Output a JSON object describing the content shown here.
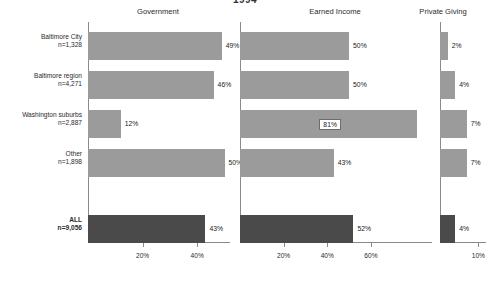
{
  "chart_data": {
    "type": "bar",
    "orientation": "horizontal",
    "title": "1994",
    "categories": [
      "Baltimore City",
      "Baltimore region",
      "Washington suburbs",
      "Other",
      "ALL"
    ],
    "category_sublabels": [
      "n=1,328",
      "n=4,271",
      "n=2,887",
      "n=1,898",
      "n=9,056"
    ],
    "panels": [
      {
        "name": "Government",
        "values": [
          49,
          46,
          12,
          50,
          43
        ],
        "value_labels": [
          "49%",
          "46%",
          "12%",
          "50%",
          "43%"
        ],
        "label_placement": [
          "outside",
          "outside",
          "outside",
          "outside",
          "outside"
        ],
        "xlim": [
          0,
          52
        ],
        "ticks": [
          20,
          40
        ],
        "tick_labels": [
          "20%",
          "40%"
        ]
      },
      {
        "name": "Earned Income",
        "values": [
          50,
          50,
          81,
          43,
          52
        ],
        "value_labels": [
          "50%",
          "50%",
          "81%",
          "43%",
          "52%"
        ],
        "label_placement": [
          "outside",
          "outside",
          "inside",
          "outside",
          "outside"
        ],
        "xlim": [
          0,
          88
        ],
        "ticks": [
          20,
          40,
          60
        ],
        "tick_labels": [
          "20%",
          "40%",
          "60%"
        ]
      },
      {
        "name": "Private Giving",
        "values": [
          2,
          4,
          7,
          7,
          4
        ],
        "value_labels": [
          "2%",
          "4%",
          "7%",
          "7%",
          "4%"
        ],
        "label_placement": [
          "outside",
          "outside",
          "outside",
          "outside",
          "outside"
        ],
        "xlim": [
          0,
          12
        ],
        "ticks": [
          10
        ],
        "tick_labels": [
          "10%"
        ]
      }
    ],
    "highlight_row": "ALL",
    "colors": {
      "bar": "#9b9b9b",
      "bar_highlight": "#4a4a4a",
      "axis": "#8a8a8a",
      "text": "#1a1a1a",
      "background": "#ffffff"
    },
    "grid": false,
    "legend": "none",
    "xlabel": "",
    "ylabel": ""
  }
}
